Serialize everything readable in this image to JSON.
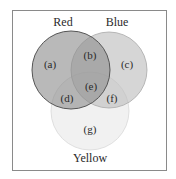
{
  "diagram": {
    "type": "venn",
    "sets": [
      {
        "name": "Red",
        "label": "Red",
        "cx": 71,
        "cy": 70,
        "r": 39,
        "fill": "#9a9a9a",
        "opacity": 0.72
      },
      {
        "name": "Blue",
        "label": "Blue",
        "cx": 109,
        "cy": 70,
        "r": 38,
        "fill": "#c8c8c8",
        "opacity": 0.7
      },
      {
        "name": "Yellow",
        "label": "Yellow",
        "cx": 90,
        "cy": 111,
        "r": 39,
        "fill": "#ececec",
        "opacity": 0.7
      }
    ],
    "regions": [
      {
        "id": "a",
        "label": "(a)",
        "x": 50,
        "y": 65
      },
      {
        "id": "b",
        "label": "(b)",
        "x": 90,
        "y": 58
      },
      {
        "id": "c",
        "label": "(c)",
        "x": 127,
        "y": 65
      },
      {
        "id": "d",
        "label": "(d)",
        "x": 67,
        "y": 101
      },
      {
        "id": "e",
        "label": "(e)",
        "x": 91,
        "y": 89
      },
      {
        "id": "f",
        "label": "(f)",
        "x": 112,
        "y": 101
      },
      {
        "id": "g",
        "label": "(g)",
        "x": 90,
        "y": 132
      }
    ],
    "set_labels": {
      "red": "Red",
      "blue": "Blue",
      "yellow": "Yellow"
    },
    "outline_color": "#555555"
  }
}
